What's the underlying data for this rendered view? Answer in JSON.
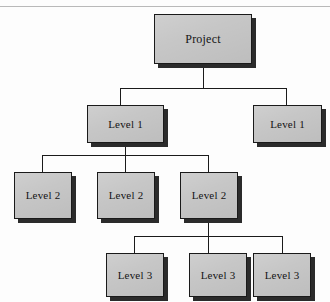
{
  "diagram": {
    "type": "tree",
    "orientation": "top-down",
    "canvas": {
      "width": 330,
      "height": 302
    },
    "style": {
      "node_fill": "#c6c6c6",
      "node_border": "#1a1a1a",
      "node_shadow": "#2b2b2b",
      "connector_color": "#1b1b1b",
      "background": "#fdfdfd",
      "scan_artifact": "#b9b9b9"
    },
    "nodes": [
      {
        "id": "root",
        "label": "Project",
        "level": 0,
        "x": 154,
        "y": 14,
        "w": 98,
        "h": 50
      },
      {
        "id": "l1a",
        "label": "Level 1",
        "level": 1,
        "x": 87,
        "y": 105,
        "w": 77,
        "h": 38
      },
      {
        "id": "l1b",
        "label": "Level 1",
        "level": 1,
        "x": 253,
        "y": 105,
        "w": 69,
        "h": 38
      },
      {
        "id": "l2a",
        "label": "Level 2",
        "level": 2,
        "x": 14,
        "y": 172,
        "w": 58,
        "h": 47
      },
      {
        "id": "l2b",
        "label": "Level 2",
        "level": 2,
        "x": 97,
        "y": 172,
        "w": 58,
        "h": 47
      },
      {
        "id": "l2c",
        "label": "Level 2",
        "level": 2,
        "x": 180,
        "y": 172,
        "w": 58,
        "h": 47
      },
      {
        "id": "l3a",
        "label": "Level 3",
        "level": 3,
        "x": 106,
        "y": 253,
        "w": 58,
        "h": 44
      },
      {
        "id": "l3b",
        "label": "Level 3",
        "level": 3,
        "x": 189,
        "y": 253,
        "w": 58,
        "h": 44
      },
      {
        "id": "l3c",
        "label": "Level 3",
        "level": 3,
        "x": 253,
        "y": 253,
        "w": 58,
        "h": 44
      }
    ],
    "edges": [
      {
        "from": "root",
        "to": "l1a"
      },
      {
        "from": "root",
        "to": "l1b"
      },
      {
        "from": "l1a",
        "to": "l2a"
      },
      {
        "from": "l1a",
        "to": "l2b"
      },
      {
        "from": "l1a",
        "to": "l2c"
      },
      {
        "from": "l2c",
        "to": "l3a"
      },
      {
        "from": "l2c",
        "to": "l3b"
      },
      {
        "from": "l2c",
        "to": "l3c"
      }
    ],
    "connector_segments": [
      {
        "id": "root-stem",
        "orient": "v",
        "x": 203,
        "y": 64,
        "len": 24
      },
      {
        "id": "l1-bus",
        "orient": "h",
        "x": 120,
        "y": 88,
        "len": 166
      },
      {
        "id": "l1a-drop",
        "orient": "v",
        "x": 120,
        "y": 88,
        "len": 17
      },
      {
        "id": "l1b-drop",
        "orient": "v",
        "x": 286,
        "y": 88,
        "len": 17
      },
      {
        "id": "l1a-stem",
        "orient": "v",
        "x": 125,
        "y": 143,
        "len": 12
      },
      {
        "id": "l2-bus",
        "orient": "h",
        "x": 42,
        "y": 155,
        "len": 166
      },
      {
        "id": "l2a-drop",
        "orient": "v",
        "x": 42,
        "y": 155,
        "len": 17
      },
      {
        "id": "l2b-drop",
        "orient": "v",
        "x": 125,
        "y": 155,
        "len": 17
      },
      {
        "id": "l2c-drop",
        "orient": "v",
        "x": 208,
        "y": 155,
        "len": 17
      },
      {
        "id": "l2c-stem",
        "orient": "v",
        "x": 208,
        "y": 219,
        "len": 17
      },
      {
        "id": "l3-bus",
        "orient": "h",
        "x": 134,
        "y": 236,
        "len": 148
      },
      {
        "id": "l3a-drop",
        "orient": "v",
        "x": 134,
        "y": 236,
        "len": 17
      },
      {
        "id": "l3b-drop",
        "orient": "v",
        "x": 208,
        "y": 236,
        "len": 17
      },
      {
        "id": "l3c-drop",
        "orient": "v",
        "x": 282,
        "y": 236,
        "len": 17
      }
    ]
  }
}
